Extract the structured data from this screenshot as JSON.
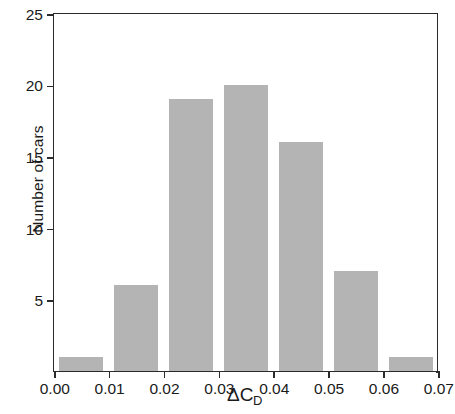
{
  "chart_data": {
    "type": "bar",
    "title": "",
    "subtitle": "",
    "xlabel": "ΔC",
    "xlabel_subscript": "D",
    "ylabel": "Number of cars",
    "categories": [
      "0.000–0.010",
      "0.010–0.020",
      "0.020–0.030",
      "0.030–0.040",
      "0.040–0.050",
      "0.050–0.060",
      "0.060–0.070"
    ],
    "bin_edges": [
      0.0,
      0.01,
      0.02,
      0.03,
      0.04,
      0.05,
      0.06,
      0.07
    ],
    "bin_centers": [
      0.005,
      0.015,
      0.025,
      0.035,
      0.045,
      0.055,
      0.065
    ],
    "values": [
      1,
      6,
      19,
      20,
      16,
      7,
      1
    ],
    "total_count": 70,
    "xlim": [
      0.0,
      0.07
    ],
    "ylim": [
      0,
      25
    ],
    "xticks": [
      0.0,
      0.01,
      0.02,
      0.03,
      0.04,
      0.05,
      0.06,
      0.07
    ],
    "xtick_labels": [
      "0.00",
      "0.01",
      "0.02",
      "0.03",
      "0.04",
      "0.05",
      "0.06",
      "0.07"
    ],
    "yticks": [
      5,
      10,
      15,
      20,
      25
    ],
    "ytick_labels": [
      "5",
      "10",
      "15",
      "20",
      "25"
    ],
    "grid": false,
    "legend": null,
    "legend_position": "none",
    "bar_color": "#b4b4b4",
    "axis_color": "#2b2b2b",
    "background_color": "#ffffff",
    "bar_width_fraction": 0.8,
    "annotations": []
  }
}
